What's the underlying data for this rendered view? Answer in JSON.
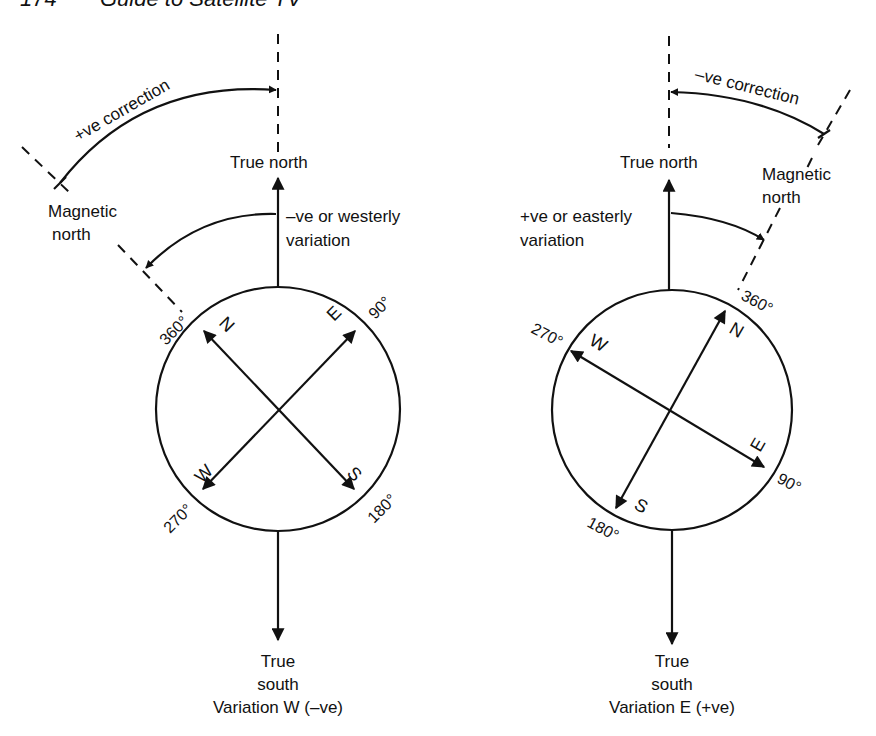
{
  "header": {
    "page_number": "174",
    "running_title": "Guide to Satellite TV"
  },
  "left_diagram": {
    "true_north_label": "True north",
    "magnetic_north_label_line1": "Magnetic",
    "magnetic_north_label_line2": "north",
    "correction_label": "+ve correction",
    "variation_label_line1": "–ve or westerly",
    "variation_label_line2": "variation",
    "compass_points": {
      "N": "N",
      "E": "E",
      "S": "S",
      "W": "W"
    },
    "degree_labels": {
      "deg360": "360°",
      "deg90": "90°",
      "deg180": "180°",
      "deg270": "270°"
    },
    "true_south_line1": "True",
    "true_south_line2": "south",
    "caption": "Variation W (–ve)"
  },
  "right_diagram": {
    "true_north_label": "True north",
    "magnetic_north_label_line1": "Magnetic",
    "magnetic_north_label_line2": "north",
    "correction_label": "–ve correction",
    "variation_label_line1": "+ve or easterly",
    "variation_label_line2": "variation",
    "compass_points": {
      "N": "N",
      "E": "E",
      "S": "S",
      "W": "W"
    },
    "degree_labels": {
      "deg360": "360°",
      "deg90": "90°",
      "deg180": "180°",
      "deg270": "270°"
    },
    "true_south_line1": "True",
    "true_south_line2": "south",
    "caption": "Variation E (+ve)"
  }
}
